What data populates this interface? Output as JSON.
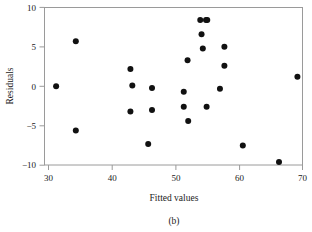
{
  "chart_data": {
    "type": "scatter",
    "title": "",
    "xlabel": "Fitted values",
    "ylabel": "Residuals",
    "caption": "(b)",
    "xlim": [
      29.0,
      71.0
    ],
    "ylim": [
      -10.8,
      10.6
    ],
    "xticks": [
      30,
      40,
      50,
      60,
      70
    ],
    "yticks": [
      10,
      5,
      0,
      -5,
      -10
    ],
    "xticklabels": [
      "30",
      "40",
      "50",
      "60",
      "70"
    ],
    "yticklabels": [
      "10",
      "5",
      "0",
      "−5",
      "−10"
    ],
    "grid": false,
    "legend": null,
    "marker": "circle",
    "marker_color": "#111111",
    "marker_size": 3.0,
    "frame_color": "#9a9a9a",
    "background": "#ffffff",
    "n_points": 25,
    "points": [
      {
        "x": 31.2,
        "y": 0.0
      },
      {
        "x": 34.3,
        "y": 5.7
      },
      {
        "x": 34.3,
        "y": -5.6
      },
      {
        "x": 42.9,
        "y": 2.2
      },
      {
        "x": 43.2,
        "y": 0.1
      },
      {
        "x": 42.9,
        "y": -3.2
      },
      {
        "x": 45.7,
        "y": -7.3
      },
      {
        "x": 46.3,
        "y": -0.2
      },
      {
        "x": 46.3,
        "y": -3.0
      },
      {
        "x": 51.3,
        "y": -0.7
      },
      {
        "x": 51.3,
        "y": -2.6
      },
      {
        "x": 51.9,
        "y": 3.3
      },
      {
        "x": 52.0,
        "y": -4.4
      },
      {
        "x": 53.9,
        "y": 8.4
      },
      {
        "x": 54.8,
        "y": 8.4
      },
      {
        "x": 54.1,
        "y": 6.6
      },
      {
        "x": 54.3,
        "y": 4.8
      },
      {
        "x": 54.9,
        "y": -2.6
      },
      {
        "x": 57.0,
        "y": -0.3
      },
      {
        "x": 57.7,
        "y": 5.0
      },
      {
        "x": 57.7,
        "y": 2.6
      },
      {
        "x": 60.6,
        "y": -7.5
      },
      {
        "x": 66.3,
        "y": -9.6
      },
      {
        "x": 69.2,
        "y": 1.2
      },
      {
        "x": 55.0,
        "y": 8.4
      }
    ]
  },
  "figure": {
    "xlabel": "Fitted values",
    "ylabel": "Residuals",
    "caption": "(b)",
    "xticklabels": [
      "30",
      "40",
      "50",
      "60",
      "70"
    ],
    "yticklabels": [
      "10",
      "5",
      "0",
      "−5",
      "−10"
    ]
  }
}
